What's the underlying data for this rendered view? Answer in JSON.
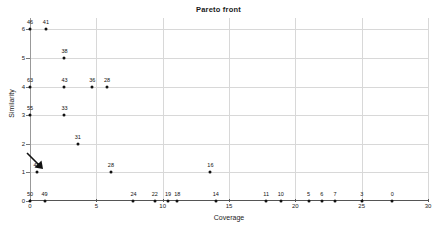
{
  "chart_data": {
    "type": "scatter",
    "title": "Pareto front",
    "xlabel": "Coverage",
    "ylabel": "Similarity",
    "xlim": [
      0,
      30
    ],
    "ylim": [
      0,
      6.4
    ],
    "xticks": [
      0,
      5,
      10,
      15,
      20,
      25,
      30
    ],
    "yticks": [
      0,
      1,
      2,
      3,
      4,
      5,
      6
    ],
    "grid": true,
    "legend": "none",
    "points": [
      {
        "x": 0.0,
        "y": 6,
        "label": "46"
      },
      {
        "x": 1.2,
        "y": 6,
        "label": "41"
      },
      {
        "x": 2.6,
        "y": 5,
        "label": "38"
      },
      {
        "x": 0.0,
        "y": 4,
        "label": "63"
      },
      {
        "x": 2.6,
        "y": 4,
        "label": "43"
      },
      {
        "x": 4.7,
        "y": 4,
        "label": "36"
      },
      {
        "x": 5.8,
        "y": 4,
        "label": "28"
      },
      {
        "x": 0.0,
        "y": 3,
        "label": "55"
      },
      {
        "x": 2.6,
        "y": 3,
        "label": "33"
      },
      {
        "x": 3.6,
        "y": 2,
        "label": "31"
      },
      {
        "x": 0.5,
        "y": 1,
        "label": "48"
      },
      {
        "x": 6.1,
        "y": 1,
        "label": "28"
      },
      {
        "x": 13.6,
        "y": 1,
        "label": "16"
      },
      {
        "x": 0.0,
        "y": 0,
        "label": "50"
      },
      {
        "x": 1.1,
        "y": 0,
        "label": "49"
      },
      {
        "x": 7.8,
        "y": 0,
        "label": "24"
      },
      {
        "x": 9.4,
        "y": 0,
        "label": "22"
      },
      {
        "x": 10.4,
        "y": 0,
        "label": "19"
      },
      {
        "x": 11.1,
        "y": 0,
        "label": "18"
      },
      {
        "x": 14.0,
        "y": 0,
        "label": "14"
      },
      {
        "x": 17.8,
        "y": 0,
        "label": "11"
      },
      {
        "x": 18.9,
        "y": 0,
        "label": "10"
      },
      {
        "x": 21.0,
        "y": 0,
        "label": "5"
      },
      {
        "x": 22.0,
        "y": 0,
        "label": "6"
      },
      {
        "x": 23.0,
        "y": 0,
        "label": "7"
      },
      {
        "x": 25.0,
        "y": 0,
        "label": "3"
      },
      {
        "x": 27.3,
        "y": 0,
        "label": "0"
      }
    ],
    "annotations": [
      {
        "name": "arrow-to-point-48",
        "target_label": "48",
        "shape": "arrow"
      }
    ],
    "colors": {
      "marker": "#111111",
      "grid": "#d8d8d8",
      "axis": "#555555",
      "text": "#1a1a1a",
      "background": "#ffffff"
    }
  }
}
